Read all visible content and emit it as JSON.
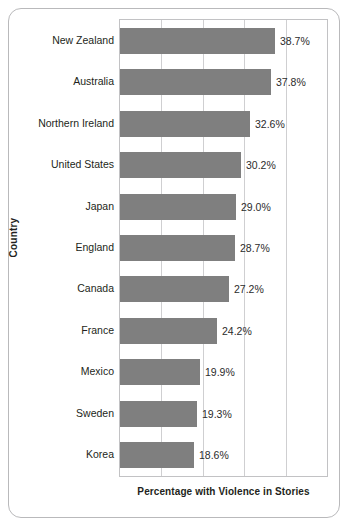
{
  "chart_data": {
    "type": "bar",
    "orientation": "horizontal",
    "title": "",
    "xlabel": "Percentage with Violence in Stories",
    "ylabel": "Country",
    "categories": [
      "New Zealand",
      "Australia",
      "Northern Ireland",
      "United States",
      "Japan",
      "England",
      "Canada",
      "France",
      "Mexico",
      "Sweden",
      "Korea"
    ],
    "values": [
      38.7,
      37.8,
      32.6,
      30.2,
      29.0,
      28.7,
      27.2,
      24.2,
      19.9,
      19.3,
      18.6
    ],
    "data_labels": [
      "38.7%",
      "37.8%",
      "32.6%",
      "30.2%",
      "29.0%",
      "28.7%",
      "27.2%",
      "24.2%",
      "19.9%",
      "19.3%",
      "18.6%"
    ],
    "xlim": [
      0,
      51.8
    ],
    "ylim": [
      0,
      11
    ],
    "grid": "vertical",
    "gridline_count": 4,
    "legend": "none",
    "xtick_labels": [],
    "ytick_labels": [],
    "colors": {
      "bar_fill": "#7f7f7f",
      "plot_border": "#c2c2c4",
      "gridline": "#cfcfd1",
      "card_border": "#b9b9bb",
      "text": "#231f20",
      "background": "#ffffff"
    }
  }
}
